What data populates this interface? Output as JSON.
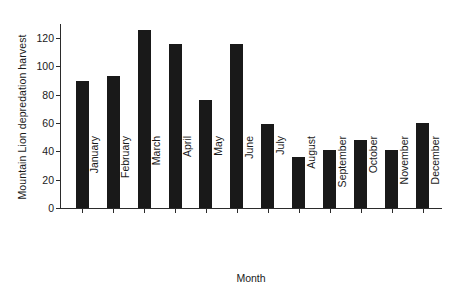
{
  "chart_data": {
    "type": "bar",
    "title": "",
    "xlabel": "Month",
    "ylabel": "Mountain Lion depredation harvest",
    "categories": [
      "January",
      "February",
      "March",
      "April",
      "May",
      "June",
      "July",
      "August",
      "September",
      "October",
      "November",
      "December"
    ],
    "values": [
      90,
      93,
      126,
      116,
      76,
      116,
      59,
      36,
      41,
      48,
      41,
      60
    ],
    "ylim": [
      0,
      130
    ],
    "yticks": [
      0,
      20,
      40,
      60,
      80,
      100,
      120
    ],
    "ytick_labels": [
      "0",
      "20",
      "40",
      "60",
      "80",
      "100",
      "120"
    ],
    "grid": false,
    "legend": false,
    "bar_color": "#191919",
    "axis_color": "#2b2b2b",
    "background": "#ffffff"
  }
}
